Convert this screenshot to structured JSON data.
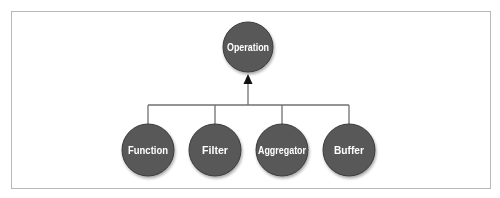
{
  "diagram": {
    "type": "hierarchy",
    "root": {
      "label": "Operation",
      "cx": 248,
      "cy": 47,
      "r": 25
    },
    "children": [
      {
        "label": "Function",
        "cx": 148,
        "cy": 150,
        "r": 26
      },
      {
        "label": "Filter",
        "cx": 215,
        "cy": 150,
        "r": 26
      },
      {
        "label": "Aggregator",
        "cx": 282,
        "cy": 150,
        "r": 26
      },
      {
        "label": "Buffer",
        "cx": 349,
        "cy": 150,
        "r": 26
      }
    ],
    "edges": [
      {
        "from": "Function",
        "to": "Operation",
        "arrow": "up"
      },
      {
        "from": "Filter",
        "to": "Operation",
        "arrow": "up"
      },
      {
        "from": "Aggregator",
        "to": "Operation",
        "arrow": "up"
      },
      {
        "from": "Buffer",
        "to": "Operation",
        "arrow": "up"
      }
    ],
    "colors": {
      "node_fill": "#595959",
      "node_stroke": "#3a3a3a",
      "node_text": "#ffffff",
      "connector": "#707070",
      "arrow": "#111111",
      "frame": "#b8b8b8"
    }
  }
}
